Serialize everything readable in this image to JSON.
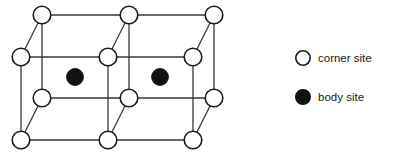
{
  "figure": {
    "background_color": "#ffffff",
    "line_color": "#3a3a3a",
    "marker_stroke_color": "#1a1a1a",
    "corner_fill_color": "#ffffff",
    "body_fill_color": "#111111",
    "line_width": 1.3,
    "marker_stroke_width": 1.6,
    "corner_radius": 8.8,
    "body_radius": 8.4
  },
  "lattice": {
    "description": "Two adjacent cubic cells drawn in oblique projection, each containing one body-centered site",
    "corner_sites": [
      {
        "name": "back-top-left",
        "x": 42,
        "y": 15,
        "type": "corner"
      },
      {
        "name": "back-top-middle",
        "x": 129,
        "y": 15,
        "type": "corner"
      },
      {
        "name": "back-top-right",
        "x": 214,
        "y": 15,
        "type": "corner"
      },
      {
        "name": "front-top-left",
        "x": 21,
        "y": 57,
        "type": "corner"
      },
      {
        "name": "front-top-middle",
        "x": 108,
        "y": 57,
        "type": "corner"
      },
      {
        "name": "front-top-right",
        "x": 193,
        "y": 57,
        "type": "corner"
      },
      {
        "name": "back-bottom-left",
        "x": 42,
        "y": 98,
        "type": "corner"
      },
      {
        "name": "back-bottom-middle",
        "x": 129,
        "y": 98,
        "type": "corner"
      },
      {
        "name": "back-bottom-right",
        "x": 214,
        "y": 98,
        "type": "corner"
      },
      {
        "name": "front-bottom-left",
        "x": 21,
        "y": 140,
        "type": "corner"
      },
      {
        "name": "front-bottom-middle",
        "x": 108,
        "y": 140,
        "type": "corner"
      },
      {
        "name": "front-bottom-right",
        "x": 193,
        "y": 140,
        "type": "corner"
      }
    ],
    "body_sites": [
      {
        "name": "body-site-left",
        "x": 75,
        "y": 77,
        "type": "body"
      },
      {
        "name": "body-site-right",
        "x": 160,
        "y": 77,
        "type": "body"
      }
    ],
    "edges": [
      {
        "name": "back-top-horizontal-left",
        "x1": 42,
        "y1": 15,
        "x2": 129,
        "y2": 15
      },
      {
        "name": "back-top-horizontal-right",
        "x1": 129,
        "y1": 15,
        "x2": 214,
        "y2": 15
      },
      {
        "name": "back-bottom-horizontal-left",
        "x1": 42,
        "y1": 98,
        "x2": 129,
        "y2": 98
      },
      {
        "name": "back-bottom-horizontal-right",
        "x1": 129,
        "y1": 98,
        "x2": 214,
        "y2": 98
      },
      {
        "name": "front-top-horizontal-left",
        "x1": 21,
        "y1": 57,
        "x2": 108,
        "y2": 57
      },
      {
        "name": "front-top-horizontal-right",
        "x1": 108,
        "y1": 57,
        "x2": 193,
        "y2": 57
      },
      {
        "name": "front-bottom-horizontal-left",
        "x1": 21,
        "y1": 140,
        "x2": 108,
        "y2": 140
      },
      {
        "name": "front-bottom-horizontal-right",
        "x1": 108,
        "y1": 140,
        "x2": 193,
        "y2": 140
      },
      {
        "name": "back-vertical-left",
        "x1": 42,
        "y1": 15,
        "x2": 42,
        "y2": 98
      },
      {
        "name": "back-vertical-middle",
        "x1": 129,
        "y1": 15,
        "x2": 129,
        "y2": 98
      },
      {
        "name": "back-vertical-right",
        "x1": 214,
        "y1": 15,
        "x2": 214,
        "y2": 98
      },
      {
        "name": "front-vertical-left",
        "x1": 21,
        "y1": 57,
        "x2": 21,
        "y2": 140
      },
      {
        "name": "front-vertical-middle",
        "x1": 108,
        "y1": 57,
        "x2": 108,
        "y2": 140
      },
      {
        "name": "front-vertical-right",
        "x1": 193,
        "y1": 57,
        "x2": 193,
        "y2": 140
      },
      {
        "name": "depth-top-left",
        "x1": 21,
        "y1": 57,
        "x2": 42,
        "y2": 15
      },
      {
        "name": "depth-top-middle",
        "x1": 108,
        "y1": 57,
        "x2": 129,
        "y2": 15
      },
      {
        "name": "depth-top-right",
        "x1": 193,
        "y1": 57,
        "x2": 214,
        "y2": 15
      },
      {
        "name": "depth-bottom-left",
        "x1": 21,
        "y1": 140,
        "x2": 42,
        "y2": 98
      },
      {
        "name": "depth-bottom-middle",
        "x1": 108,
        "y1": 140,
        "x2": 129,
        "y2": 98
      },
      {
        "name": "depth-bottom-right",
        "x1": 193,
        "y1": 140,
        "x2": 214,
        "y2": 98
      }
    ]
  },
  "legend": {
    "items": [
      {
        "marker": "open-circle",
        "label": "corner site",
        "marker_x": 303,
        "marker_y": 58,
        "marker_radius": 7.2,
        "fill": "#ffffff",
        "stroke": "#1a1a1a",
        "text_x": 318,
        "text_y": 59
      },
      {
        "marker": "filled-circle",
        "label": "body site",
        "marker_x": 303,
        "marker_y": 97,
        "marker_radius": 7.2,
        "fill": "#111111",
        "stroke": "#111111",
        "text_x": 318,
        "text_y": 98
      }
    ]
  }
}
